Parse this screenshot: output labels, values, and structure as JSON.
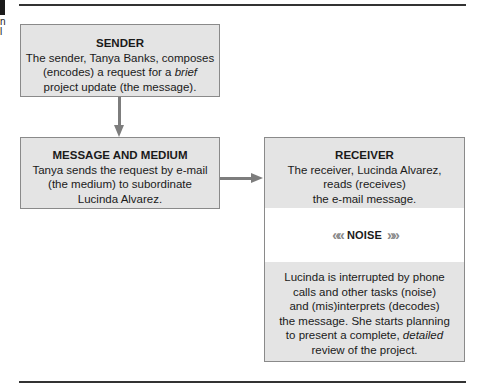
{
  "edge_fragments": [
    "n",
    "l"
  ],
  "sender": {
    "title": "SENDER",
    "lines": [
      "The sender, Tanya Banks, composes",
      "(encodes) a request for a "
    ],
    "italic": "brief",
    "line3": "project update (the message)."
  },
  "message": {
    "title": "MESSAGE AND MEDIUM",
    "lines": [
      "Tanya sends the request by e-mail",
      "(the medium) to subordinate",
      "Lucinda Alvarez."
    ]
  },
  "receiver": {
    "title": "RECEIVER",
    "lines": [
      "The receiver, Lucinda Alvarez,",
      "reads (receives)",
      "the e-mail message."
    ]
  },
  "noise": {
    "label": "NOISE",
    "left_chevrons": "««",
    "right_chevrons": "»»"
  },
  "decoding": {
    "lines": [
      "Lucinda is interrupted by phone",
      "calls and other tasks (noise)",
      "and (mis)interprets (decodes)",
      "the message. She starts planning",
      "to present a complete, "
    ],
    "italic": "detailed",
    "last_line": "review of the project."
  },
  "colors": {
    "box_fill": "#e4e4e4",
    "box_border": "#8a8a8a",
    "arrow": "#7d7d7d",
    "rule": "#333333"
  }
}
